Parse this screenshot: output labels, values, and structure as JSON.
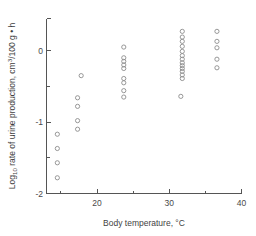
{
  "chart_data": {
    "type": "scatter",
    "title": "",
    "xlabel": "Body temperature, °C",
    "ylabel": "Log10 rate of urine production, cm3/100 g • h",
    "ylabel_parts": {
      "lead": "Log",
      "sub1": "10",
      "mid": " rate of urine production, cm",
      "sup1": "3",
      "tail": "/100 g • h"
    },
    "xlabel_parts": {
      "text": "Body temperature, ",
      "degree": "°C"
    },
    "xlim": [
      13,
      40
    ],
    "ylim": [
      -2,
      0.45
    ],
    "grid": false,
    "legend": null,
    "x_ticks_major": [
      20,
      30,
      40
    ],
    "x_tick_labels": [
      "20",
      "30",
      "40"
    ],
    "x_ticks_minor": [
      15,
      25,
      35
    ],
    "y_ticks_major": [
      0,
      -1,
      -2
    ],
    "y_tick_labels": [
      "0",
      "-1",
      "-2"
    ],
    "y_ticks_minor": [
      -0.5,
      -1.5
    ],
    "marker_style": "open-circle",
    "marker_color": "#8c8c8c",
    "point_count": 56,
    "series": [
      {
        "name": "urine production vs body temperature",
        "points": [
          [
            14.5,
            -1.17
          ],
          [
            14.5,
            -1.37
          ],
          [
            14.5,
            -1.57
          ],
          [
            14.5,
            -1.78
          ],
          [
            17.3,
            -0.66
          ],
          [
            17.3,
            -0.78
          ],
          [
            17.3,
            -0.98
          ],
          [
            17.3,
            -1.1
          ],
          [
            17.8,
            -0.35
          ],
          [
            23.7,
            0.05
          ],
          [
            23.7,
            -0.1
          ],
          [
            23.7,
            -0.15
          ],
          [
            23.7,
            -0.2
          ],
          [
            23.7,
            -0.25
          ],
          [
            23.7,
            -0.39
          ],
          [
            23.7,
            -0.45
          ],
          [
            23.7,
            -0.56
          ],
          [
            23.7,
            -0.65
          ],
          [
            31.8,
            0.27
          ],
          [
            31.8,
            0.19
          ],
          [
            31.8,
            0.13
          ],
          [
            31.8,
            0.06
          ],
          [
            31.8,
            -0.01
          ],
          [
            31.8,
            -0.07
          ],
          [
            31.8,
            -0.12
          ],
          [
            31.8,
            -0.17
          ],
          [
            31.8,
            -0.21
          ],
          [
            31.8,
            -0.25
          ],
          [
            31.8,
            -0.29
          ],
          [
            31.8,
            -0.34
          ],
          [
            31.8,
            -0.39
          ],
          [
            31.6,
            -0.64
          ],
          [
            36.6,
            0.27
          ],
          [
            36.6,
            0.13
          ],
          [
            36.6,
            0.04
          ],
          [
            36.6,
            -0.12
          ],
          [
            36.6,
            -0.24
          ]
        ]
      }
    ]
  },
  "axes": {
    "x_axis_name": "x-axis",
    "y_axis_name": "y-axis"
  }
}
